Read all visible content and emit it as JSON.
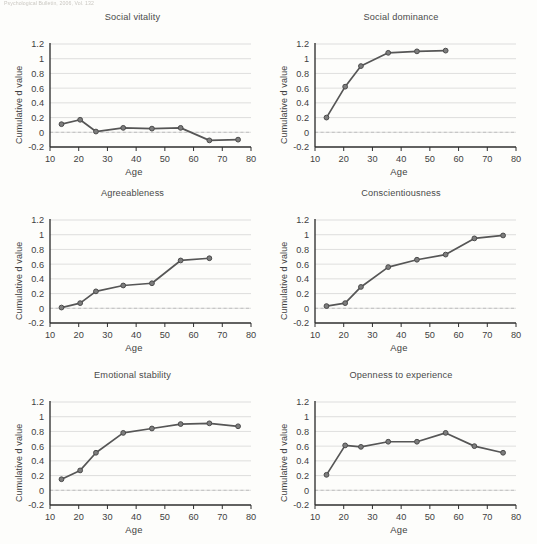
{
  "running_head": "Psychological Bulletin, 2006, Vol. 132",
  "axes": {
    "ylabel": "Cumulative d value",
    "xlabel": "Age",
    "yticks": [
      "1.2",
      "1",
      "0.8",
      "0.6",
      "0.4",
      "0.2",
      "0",
      "-0.2"
    ],
    "ytick_values": [
      1.2,
      1.0,
      0.8,
      0.6,
      0.4,
      0.2,
      0.0,
      -0.2
    ],
    "xticks": [
      "10",
      "20",
      "30",
      "40",
      "50",
      "60",
      "70",
      "80"
    ],
    "xtick_values": [
      10,
      20,
      30,
      40,
      50,
      60,
      70,
      80
    ],
    "ylim": [
      -0.2,
      1.2
    ],
    "xlim": [
      10,
      80
    ],
    "grid": true,
    "zero_reference_line": true
  },
  "colors": {
    "line": "#565656",
    "marker_fill": "#7d7d7d",
    "marker_stroke": "#4a4a4a",
    "gridline": "#c9c9c9",
    "zeroline": "#b5b5b5",
    "axis": "#2e2e2e",
    "background": "#fdfdfb",
    "text": "#3f3f3f"
  },
  "chart_data": [
    {
      "type": "line",
      "title": "Social vitality",
      "xlabel": "Age",
      "ylabel": "Cumulative d value",
      "xlim": [
        10,
        80
      ],
      "ylim": [
        -0.2,
        1.2
      ],
      "grid": true,
      "legend": "none",
      "x": [
        14,
        20.5,
        26,
        35.5,
        45.5,
        55.5,
        65.5,
        75.5
      ],
      "values": [
        0.11,
        0.17,
        0.01,
        0.06,
        0.05,
        0.06,
        -0.11,
        -0.1
      ]
    },
    {
      "type": "line",
      "title": "Social dominance",
      "xlabel": "Age",
      "ylabel": "Cumulative d value",
      "xlim": [
        10,
        80
      ],
      "ylim": [
        -0.2,
        1.2
      ],
      "grid": true,
      "legend": "none",
      "x": [
        14,
        20.5,
        26,
        35.5,
        45.5,
        55.5
      ],
      "values": [
        0.2,
        0.62,
        0.9,
        1.08,
        1.1,
        1.11
      ]
    },
    {
      "type": "line",
      "title": "Agreeableness",
      "xlabel": "Age",
      "ylabel": "Cumulative d value",
      "xlim": [
        10,
        80
      ],
      "ylim": [
        -0.2,
        1.2
      ],
      "grid": true,
      "legend": "none",
      "x": [
        14,
        20.5,
        26,
        35.5,
        45.5,
        55.5,
        65.5
      ],
      "values": [
        0.01,
        0.07,
        0.23,
        0.31,
        0.34,
        0.65,
        0.68
      ]
    },
    {
      "type": "line",
      "title": "Conscientiousness",
      "xlabel": "Age",
      "ylabel": "Cumulative d value",
      "xlim": [
        10,
        80
      ],
      "ylim": [
        -0.2,
        1.2
      ],
      "grid": true,
      "legend": "none",
      "x": [
        14,
        20.5,
        26,
        35.5,
        45.5,
        55.5,
        65.5,
        75.5
      ],
      "values": [
        0.03,
        0.07,
        0.29,
        0.56,
        0.66,
        0.73,
        0.95,
        0.99
      ]
    },
    {
      "type": "line",
      "title": "Emotional stability",
      "xlabel": "Age",
      "ylabel": "Cumulative d value",
      "xlim": [
        10,
        80
      ],
      "ylim": [
        -0.2,
        1.2
      ],
      "grid": true,
      "legend": "none",
      "x": [
        14,
        20.5,
        26,
        35.5,
        45.5,
        55.5,
        65.5,
        75.5
      ],
      "values": [
        0.15,
        0.27,
        0.51,
        0.78,
        0.84,
        0.9,
        0.91,
        0.87
      ]
    },
    {
      "type": "line",
      "title": "Openness to experience",
      "xlabel": "Age",
      "ylabel": "Cumulative d value",
      "xlim": [
        10,
        80
      ],
      "ylim": [
        -0.2,
        1.2
      ],
      "grid": true,
      "legend": "none",
      "x": [
        14,
        20.5,
        26,
        35.5,
        45.5,
        55.5,
        65.5,
        75.5
      ],
      "values": [
        0.21,
        0.61,
        0.59,
        0.66,
        0.66,
        0.78,
        0.6,
        0.51
      ]
    }
  ]
}
